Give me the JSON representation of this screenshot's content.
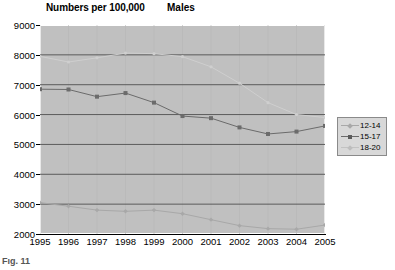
{
  "chart_data": {
    "type": "line",
    "title": "Numbers per 100,000",
    "subtitle": "Males",
    "xlabel": "",
    "ylabel": "",
    "x": [
      1995,
      1996,
      1997,
      1998,
      1999,
      2000,
      2001,
      2002,
      2003,
      2004,
      2005
    ],
    "xticklabels": [
      "1995",
      "1996",
      "1997",
      "1998",
      "1999",
      "2000",
      "2001",
      "2002",
      "2003",
      "2004",
      "2005"
    ],
    "yticklabels": [
      "2000",
      "3000",
      "4000",
      "5000",
      "6000",
      "7000",
      "8000",
      "9000"
    ],
    "yticks": [
      2000,
      3000,
      4000,
      5000,
      6000,
      7000,
      8000,
      9000
    ],
    "ylim": [
      2000,
      9000
    ],
    "xlim": [
      1995,
      2005
    ],
    "grid": "horizontal",
    "legend_position": "right",
    "plot_background": "#c0c0c0",
    "series": [
      {
        "name": "12-14",
        "color": "#a8a8a8",
        "marker": "diamond",
        "values": [
          3050,
          2930,
          2800,
          2760,
          2800,
          2680,
          2480,
          2280,
          2180,
          2160,
          2300
        ]
      },
      {
        "name": "15-17",
        "color": "#6b6b6b",
        "marker": "square",
        "values": [
          6850,
          6840,
          6600,
          6720,
          6400,
          5950,
          5880,
          5570,
          5350,
          5430,
          5620
        ]
      },
      {
        "name": "18-20",
        "color": "#cfcfcf",
        "marker": "dot",
        "values": [
          7950,
          7760,
          7900,
          8060,
          8040,
          7940,
          7600,
          7050,
          6400,
          6000,
          5900
        ]
      }
    ]
  },
  "legend": {
    "items": [
      {
        "label": "12-14"
      },
      {
        "label": "15-17"
      },
      {
        "label": "18-20"
      }
    ]
  },
  "footer": {
    "cropped_text": "Fig. 11"
  }
}
